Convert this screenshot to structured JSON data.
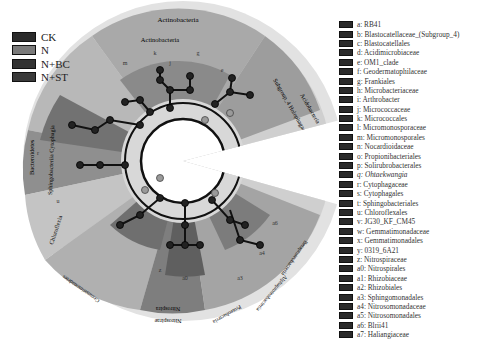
{
  "group_legend": [
    {
      "label": "CK",
      "color": "#2b2b2b"
    },
    {
      "label": "N",
      "color": "#7a7a7a"
    },
    {
      "label": "N+BC",
      "color": "#333333"
    },
    {
      "label": "N+ST",
      "color": "#3a3a3a"
    }
  ],
  "taxa_legend": [
    {
      "label": "a: RB41"
    },
    {
      "label": "b: Blastocatellaceae_(Subgroup_4)"
    },
    {
      "label": "c: Blastocatellales"
    },
    {
      "label": "d: Acidimicrobiaceae"
    },
    {
      "label": "e: OM1_clade"
    },
    {
      "label": "f: Geodermatophilaceae"
    },
    {
      "label": "g: Frankiales"
    },
    {
      "label": "h: Microbacteriaceae"
    },
    {
      "label": "i: Arthrobacter"
    },
    {
      "label": "j: Micrococcaceae"
    },
    {
      "label": "k: Micrococcales"
    },
    {
      "label": "l: Micromonosporaceae"
    },
    {
      "label": "m: Micromonosporales"
    },
    {
      "label": "n: Nocardioidaceae"
    },
    {
      "label": "o: Propionibacteriales"
    },
    {
      "label": "p: Solirubrobacterales"
    },
    {
      "label": "q: Ohtaekwangia",
      "italic": true
    },
    {
      "label": "r: Cytophagaceae"
    },
    {
      "label": "s: Cytophagales"
    },
    {
      "label": "t: Sphingobacteriales"
    },
    {
      "label": "u: Chloroflexales"
    },
    {
      "label": "v: JG30_KF_CM45"
    },
    {
      "label": "w: Gemmatimonadaceae"
    },
    {
      "label": "x: Gemmatimonadales"
    },
    {
      "label": "y: 0319_6A21"
    },
    {
      "label": "z: Nitrospiraceae"
    },
    {
      "label": "a0: Nitrospirales"
    },
    {
      "label": "a1: Rhizobiaceae"
    },
    {
      "label": "a2: Rhizobiales"
    },
    {
      "label": "a3: Sphingomonadales"
    },
    {
      "label": "a4: Nitrosomonadaceae"
    },
    {
      "label": "a5: Nitrosomonadales"
    },
    {
      "label": "a6: Blrii41"
    },
    {
      "label": "a7: Haliangiaceae"
    }
  ],
  "clade_labels": {
    "actinobacteria_outer": "Actinobacteria",
    "actinobacteria_inner": "Actinobacteria",
    "acidobacteria": "Acidobacteria",
    "blastocatellia": "Subgroup_4  Holophagae",
    "blastocatellia_side": "Blastocatellia",
    "bacteroidetes": "Bacteroidetes",
    "sphingobacteriia": "Sphingobacteriia  Cytophagia",
    "chloroflexia": "Chloroflexia",
    "gemmatimonadetes": "Gemmatimonadetes",
    "nitrospira_inner": "Nitrospira",
    "nitrospirae_outer": "Nitrospirae",
    "alphaproteobacteria": "Alphaproteobacteria",
    "betaproteobacteria": "Betaproteobacteria",
    "proteobacteria": "Proteobacteria"
  },
  "sector_letters": [
    "a",
    "b",
    "c",
    "d",
    "e",
    "f",
    "g",
    "h",
    "i",
    "j",
    "k",
    "l",
    "m",
    "n",
    "o",
    "p",
    "q",
    "r",
    "s",
    "t",
    "u",
    "v",
    "w",
    "x",
    "y",
    "z",
    "a0",
    "a1",
    "a2",
    "a3",
    "a4",
    "a5",
    "a6",
    "a7"
  ]
}
